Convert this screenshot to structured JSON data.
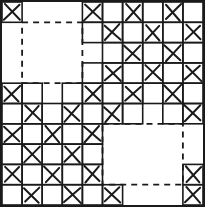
{
  "figure": {
    "type": "grid-diagram",
    "width": 205,
    "height": 207,
    "background_color": "#ffffff",
    "ink_color": "#1a1a1a",
    "grid": {
      "rows": 10,
      "cols": 10,
      "origin_x": 2,
      "origin_y": 2,
      "cell_width": 20.1,
      "cell_height": 20.3,
      "outer_border": true,
      "outer_border_width": 2.2,
      "cell_border_width": 1.6,
      "mark_stroke_width": 2.0
    },
    "mark": {
      "glyph": "X",
      "rule": "marked where (row + col) is even, except inside dashed subsquare regions"
    },
    "marked_cells": [
      [
        0,
        0
      ],
      [
        0,
        4
      ],
      [
        0,
        6
      ],
      [
        0,
        8
      ],
      [
        1,
        5
      ],
      [
        1,
        7
      ],
      [
        1,
        9
      ],
      [
        2,
        6
      ],
      [
        2,
        8
      ],
      [
        3,
        5
      ],
      [
        3,
        7
      ],
      [
        3,
        9
      ],
      [
        4,
        0
      ],
      [
        4,
        4
      ],
      [
        4,
        6
      ],
      [
        4,
        8
      ],
      [
        5,
        1
      ],
      [
        5,
        3
      ],
      [
        5,
        5
      ],
      [
        5,
        9
      ],
      [
        6,
        0
      ],
      [
        6,
        2
      ],
      [
        6,
        4
      ],
      [
        7,
        1
      ],
      [
        7,
        3
      ],
      [
        8,
        0
      ],
      [
        8,
        2
      ],
      [
        8,
        4
      ],
      [
        8,
        9
      ],
      [
        9,
        1
      ],
      [
        9,
        3
      ],
      [
        9,
        5
      ],
      [
        9,
        9
      ]
    ],
    "dashed_squares": [
      {
        "name": "top-left-dashed-square",
        "col_start": 1,
        "row_start": 1,
        "col_end": 3,
        "row_end": 3,
        "dash_pattern": "6 5",
        "stroke_width": 1.8
      },
      {
        "name": "bottom-right-dashed-square",
        "col_start": 5,
        "row_start": 6,
        "col_end": 8,
        "row_end": 8,
        "dash_pattern": "6 5",
        "stroke_width": 1.8
      }
    ]
  }
}
